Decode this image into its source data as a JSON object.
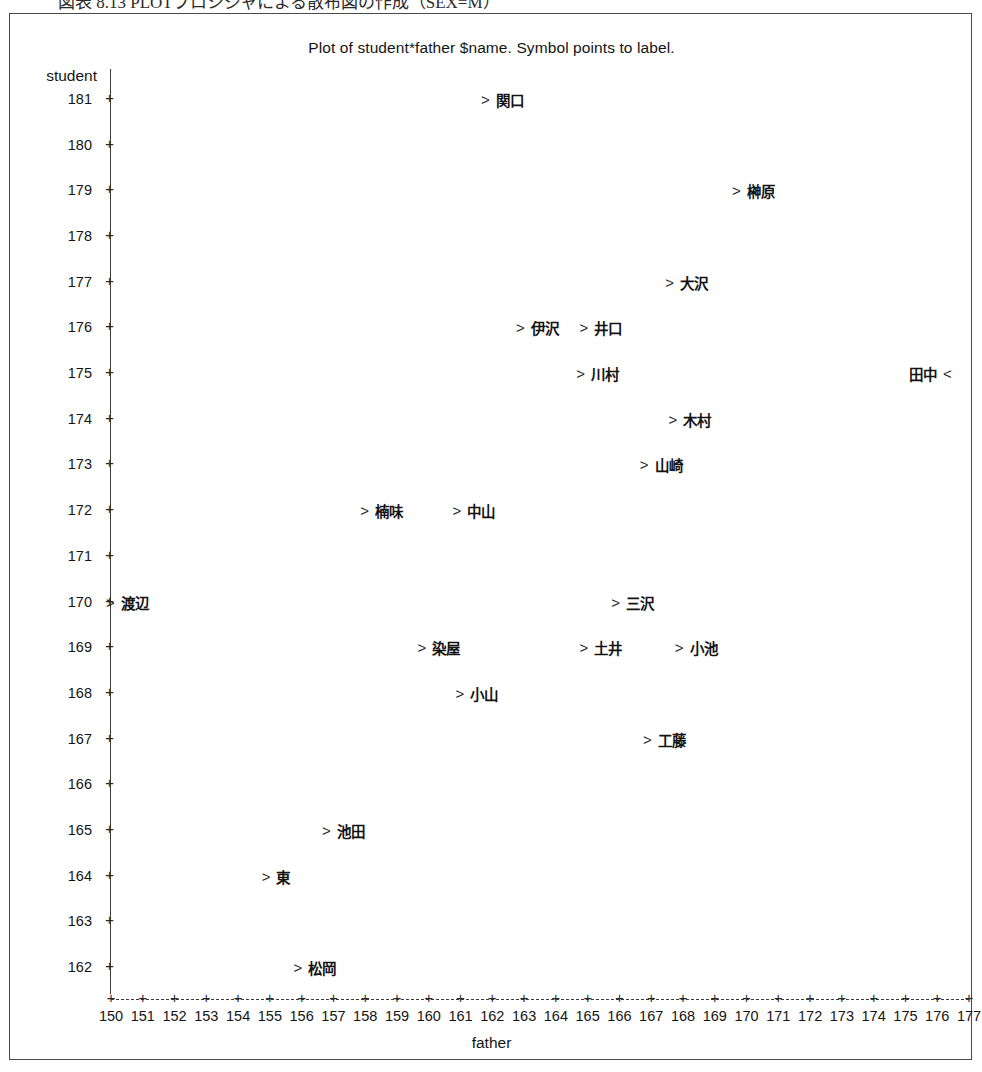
{
  "caption": {
    "text": "図表 8.13  PLOTプロシジャによる散布図の作成（SEX=M）"
  },
  "chart_data": {
    "type": "scatter",
    "title": "Plot of student*father $name.  Symbol points to label.",
    "xlabel": "father",
    "ylabel": "student",
    "xlim": [
      150,
      177
    ],
    "ylim": [
      162,
      181
    ],
    "grid": false,
    "legend": "none",
    "xticks": [
      150,
      151,
      152,
      153,
      154,
      155,
      156,
      157,
      158,
      159,
      160,
      161,
      162,
      163,
      164,
      165,
      166,
      167,
      168,
      169,
      170,
      171,
      172,
      173,
      174,
      175,
      176,
      177
    ],
    "yticks": [
      162,
      163,
      164,
      165,
      166,
      167,
      168,
      169,
      170,
      171,
      172,
      173,
      174,
      175,
      176,
      177,
      178,
      179,
      180,
      181
    ],
    "marker_right": ">",
    "marker_left": "<",
    "points": [
      {
        "label": "関口",
        "x": 161.8,
        "y": 181,
        "marker_side": "left"
      },
      {
        "label": "榊原",
        "x": 169.7,
        "y": 179,
        "marker_side": "left"
      },
      {
        "label": "大沢",
        "x": 167.6,
        "y": 177,
        "marker_side": "left"
      },
      {
        "label": "伊沢",
        "x": 162.9,
        "y": 176,
        "marker_side": "left"
      },
      {
        "label": "井口",
        "x": 164.9,
        "y": 176,
        "marker_side": "left"
      },
      {
        "label": "川村",
        "x": 164.8,
        "y": 175,
        "marker_side": "left"
      },
      {
        "label": "田中",
        "x": 177.0,
        "y": 175,
        "marker_side": "right"
      },
      {
        "label": "木村",
        "x": 167.7,
        "y": 174,
        "marker_side": "left"
      },
      {
        "label": "山崎",
        "x": 166.8,
        "y": 173,
        "marker_side": "left"
      },
      {
        "label": "楠味",
        "x": 158.0,
        "y": 172,
        "marker_side": "left"
      },
      {
        "label": "中山",
        "x": 160.9,
        "y": 172,
        "marker_side": "left"
      },
      {
        "label": "渡辺",
        "x": 150.0,
        "y": 170,
        "marker_side": "left"
      },
      {
        "label": "三沢",
        "x": 165.9,
        "y": 170,
        "marker_side": "left"
      },
      {
        "label": "染屋",
        "x": 159.8,
        "y": 169,
        "marker_side": "left"
      },
      {
        "label": "土井",
        "x": 164.9,
        "y": 169,
        "marker_side": "left"
      },
      {
        "label": "小池",
        "x": 167.9,
        "y": 169,
        "marker_side": "left"
      },
      {
        "label": "小山",
        "x": 161.0,
        "y": 168,
        "marker_side": "left"
      },
      {
        "label": "工藤",
        "x": 166.9,
        "y": 167,
        "marker_side": "left"
      },
      {
        "label": "池田",
        "x": 156.8,
        "y": 165,
        "marker_side": "left"
      },
      {
        "label": "東",
        "x": 154.9,
        "y": 164,
        "marker_side": "left"
      },
      {
        "label": "松岡",
        "x": 155.9,
        "y": 162,
        "marker_side": "left"
      }
    ]
  }
}
